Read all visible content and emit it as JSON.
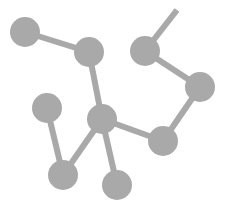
{
  "diagram": {
    "type": "molecule-network",
    "width": 227,
    "height": 207,
    "colors": {
      "node": "#a9a9a9",
      "edge": "#a9a9a9",
      "background": "#ffffff"
    },
    "node_radius": 15,
    "edge_width": 6,
    "nodes": [
      {
        "id": "n1",
        "x": 25,
        "y": 32
      },
      {
        "id": "n2",
        "x": 89,
        "y": 52
      },
      {
        "id": "n3",
        "x": 145,
        "y": 51
      },
      {
        "id": "n4",
        "x": 200,
        "y": 87
      },
      {
        "id": "n5",
        "x": 47,
        "y": 108
      },
      {
        "id": "n6",
        "x": 102,
        "y": 119
      },
      {
        "id": "n7",
        "x": 163,
        "y": 141
      },
      {
        "id": "n8",
        "x": 63,
        "y": 175
      },
      {
        "id": "n9",
        "x": 117,
        "y": 185
      }
    ],
    "free_ends": [
      {
        "id": "e_top",
        "x": 177,
        "y": 10
      }
    ],
    "edges": [
      [
        "n1",
        "n2"
      ],
      [
        "n2",
        "n6"
      ],
      [
        "n3",
        "e_top"
      ],
      [
        "n3",
        "n4"
      ],
      [
        "n4",
        "n7"
      ],
      [
        "n6",
        "n7"
      ],
      [
        "n5",
        "n8"
      ],
      [
        "n6",
        "n8"
      ],
      [
        "n6",
        "n9"
      ]
    ]
  }
}
